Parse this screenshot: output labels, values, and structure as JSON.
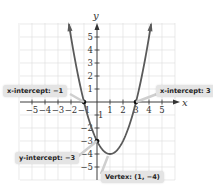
{
  "chart_data": {
    "type": "line",
    "title": "",
    "function": "y = x^2 - 2x - 3",
    "xlabel": "x",
    "ylabel": "y",
    "xlim": [
      -6,
      6
    ],
    "ylim": [
      -6,
      6
    ],
    "grid": true,
    "x_ticks": [
      -5,
      -4,
      -3,
      -2,
      -1,
      1,
      2,
      3,
      4,
      5
    ],
    "y_ticks": [
      -5,
      -4,
      -3,
      -2,
      -1,
      1,
      2,
      3,
      4,
      5
    ],
    "x_tick_labels": [
      "−5",
      "−4",
      "−3",
      "−2",
      "−1",
      "1",
      "2",
      "3",
      "4",
      "5"
    ],
    "y_tick_labels": [
      "−5",
      "−4",
      "−3",
      "−2",
      "−1",
      "1",
      "2",
      "3",
      "4",
      "5"
    ],
    "series": [
      {
        "name": "parabola",
        "x": [
          -2.16,
          -2,
          -1.5,
          -1,
          -0.5,
          0,
          0.5,
          1,
          1.5,
          2,
          2.5,
          3,
          3.5,
          4,
          4.16
        ],
        "y": [
          6,
          5,
          2.25,
          0,
          -1.75,
          -3,
          -3.75,
          -4,
          -3.75,
          -3,
          -1.75,
          0,
          2.25,
          5,
          6
        ],
        "color": "#5a5a5a"
      }
    ],
    "points": [
      {
        "label": "x-intercept: −1",
        "x": -1,
        "y": 0
      },
      {
        "label": "x-intercept: 3",
        "x": 3,
        "y": 0
      },
      {
        "label": "y-intercept: −3",
        "x": 0,
        "y": -3
      },
      {
        "label": "Vertex: (1, −4)",
        "x": 1,
        "y": -4
      }
    ],
    "annotations": [
      "x-intercept: −1",
      "x-intercept: 3",
      "y-intercept: −3",
      "Vertex: (1, −4)"
    ]
  },
  "labels": {
    "x_axis": "x",
    "y_axis": "y",
    "x_intercept_left": "x-intercept: −1",
    "x_intercept_right": "x-intercept: 3",
    "y_intercept": "y-intercept: −3",
    "vertex": "Vertex: (1, −4)"
  },
  "colors": {
    "curve": "#5a5a5a",
    "grid": "#dcdcdc",
    "callout_bg": "#e4e4e4"
  }
}
